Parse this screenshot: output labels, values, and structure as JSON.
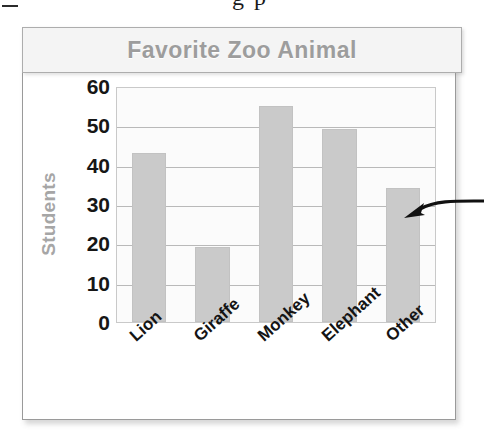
{
  "top_caption": {
    "partial_text": "g p"
  },
  "chart_data": {
    "type": "bar",
    "title": "Favorite Zoo Animal",
    "xlabel": "",
    "ylabel": "Students",
    "categories": [
      "Lion",
      "Giraffe",
      "Monkey",
      "Elephant",
      "Other"
    ],
    "values": [
      43,
      19,
      55,
      49,
      34
    ],
    "ylim": [
      0,
      60
    ],
    "ytick_labels": [
      "60",
      "50",
      "40",
      "30",
      "20",
      "10",
      "0"
    ],
    "ytick_values": [
      60,
      50,
      40,
      30,
      20,
      10,
      0
    ],
    "grid": true,
    "legend": "none",
    "bar_color": "#cacaca",
    "title_color": "#9d9d9d",
    "axis_label_color": "#a6a6a6",
    "tick_color": "#161616",
    "plot_background": "#fbfbfb",
    "gridline_color": "#b9b9b9"
  },
  "annotation": {
    "arrow_target": "Other",
    "arrow_color": "#111111"
  }
}
